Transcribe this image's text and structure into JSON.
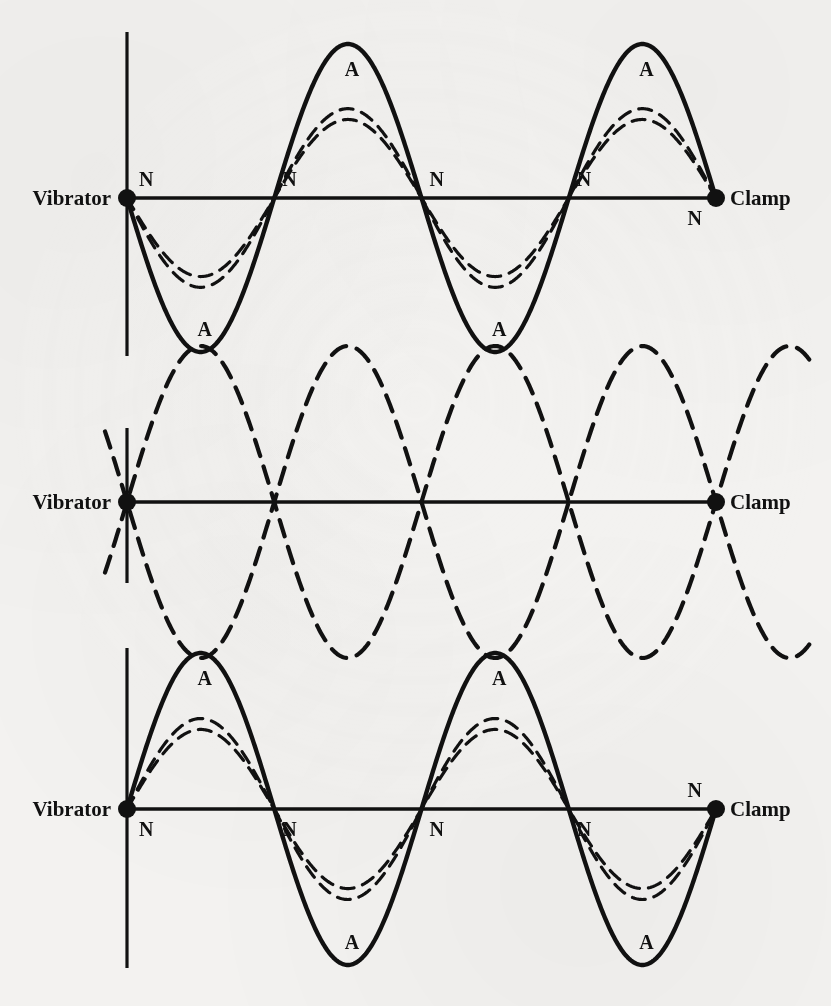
{
  "figure": {
    "background_color": "#f3f2f0",
    "ink_color": "#111111",
    "label_vibrator": "Vibrator",
    "label_clamp": "Clamp",
    "label_node": "N",
    "label_antinode": "A"
  },
  "chart_data": {
    "type": "line",
    "xlabel": "",
    "ylabel": "",
    "grid": false,
    "legend": "none",
    "xlim": [
      0,
      1
    ],
    "ylim": [
      -1,
      1
    ],
    "shared_notes": "Three snapshots of the same standing-wave pattern. x is the fractional distance from the vibrator (x=0) to the clamp (x=1). Each panel shows a bold solid envelope curve plus two lighter dashed intermediate-amplitude curves, except the middle panel which shows only the two dashed mirror-image extreme displacements.",
    "panels": [
      {
        "name": "panel-top",
        "index": 1,
        "phase": "downward first loop (negative displacement at the vibrator end)",
        "wavelength_fraction": 0.5,
        "loops": 4,
        "curves": [
          {
            "name": "solid-envelope",
            "style": "solid",
            "amplitude": 1.0,
            "sign": -1
          },
          {
            "name": "dashed-outer",
            "style": "dashed",
            "amplitude": 0.58,
            "sign": -1
          },
          {
            "name": "dashed-inner",
            "style": "dashed",
            "amplitude": 0.51,
            "sign": -1
          }
        ],
        "node_labels": [
          {
            "text": "N",
            "x": 0.0,
            "position": "above-axis"
          },
          {
            "text": "N",
            "x": 0.25,
            "position": "above-axis"
          },
          {
            "text": "N",
            "x": 0.5,
            "position": "above-axis"
          },
          {
            "text": "N",
            "x": 0.75,
            "position": "above-axis"
          },
          {
            "text": "N",
            "x": 1.0,
            "position": "below-axis"
          }
        ],
        "antinode_labels": [
          {
            "text": "A",
            "x": 0.125,
            "position": "below-axis"
          },
          {
            "text": "A",
            "x": 0.375,
            "position": "above-axis"
          },
          {
            "text": "A",
            "x": 0.625,
            "position": "below-axis"
          },
          {
            "text": "A",
            "x": 0.875,
            "position": "above-axis"
          }
        ],
        "end_labels": [
          {
            "text": "Vibrator",
            "x": 0.0
          },
          {
            "text": "Clamp",
            "x": 1.0
          }
        ]
      },
      {
        "name": "panel-middle",
        "index": 2,
        "phase": "both extreme displacements shown together (envelope only)",
        "wavelength_fraction": 0.5,
        "loops": 4,
        "curves": [
          {
            "name": "dashed-positive",
            "style": "dashed",
            "amplitude": 1.0,
            "sign": 1
          },
          {
            "name": "dashed-negative",
            "style": "dashed",
            "amplitude": 1.0,
            "sign": -1
          }
        ],
        "node_labels": [],
        "antinode_labels": [],
        "end_labels": [
          {
            "text": "Vibrator",
            "x": 0.0
          },
          {
            "text": "Clamp",
            "x": 1.0
          }
        ]
      },
      {
        "name": "panel-bottom",
        "index": 3,
        "phase": "upward first loop (positive displacement at the vibrator end)",
        "wavelength_fraction": 0.5,
        "loops": 4,
        "curves": [
          {
            "name": "solid-envelope",
            "style": "solid",
            "amplitude": 1.0,
            "sign": 1
          },
          {
            "name": "dashed-outer",
            "style": "dashed",
            "amplitude": 0.58,
            "sign": 1
          },
          {
            "name": "dashed-inner",
            "style": "dashed",
            "amplitude": 0.51,
            "sign": 1
          }
        ],
        "node_labels": [
          {
            "text": "N",
            "x": 0.0,
            "position": "below-axis"
          },
          {
            "text": "N",
            "x": 0.25,
            "position": "below-axis"
          },
          {
            "text": "N",
            "x": 0.5,
            "position": "below-axis"
          },
          {
            "text": "N",
            "x": 0.75,
            "position": "below-axis"
          },
          {
            "text": "N",
            "x": 1.0,
            "position": "above-axis"
          }
        ],
        "antinode_labels": [
          {
            "text": "A",
            "x": 0.125,
            "position": "above-axis"
          },
          {
            "text": "A",
            "x": 0.375,
            "position": "below-axis"
          },
          {
            "text": "A",
            "x": 0.625,
            "position": "above-axis"
          },
          {
            "text": "A",
            "x": 0.875,
            "position": "below-axis"
          }
        ],
        "end_labels": [
          {
            "text": "Vibrator",
            "x": 0.0
          },
          {
            "text": "Clamp",
            "x": 1.0
          }
        ]
      }
    ]
  }
}
